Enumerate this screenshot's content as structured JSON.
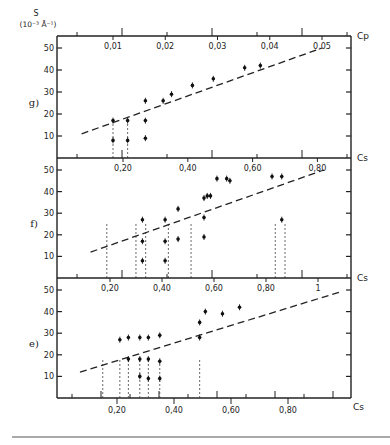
{
  "figure": {
    "y_axis_label": "S",
    "y_axis_unit": "(10⁻³ Å⁻¹)",
    "bottom_rule": true
  },
  "chart_data": [
    {
      "panel": "g)",
      "type": "scatter",
      "top_axis": {
        "label": "Cp",
        "ticks": [
          "0,01",
          "0,02",
          "0,03",
          "0,04",
          "0,05"
        ],
        "values": [
          0.01,
          0.02,
          0.03,
          0.04,
          0.05
        ]
      },
      "ylabel": "S (10^-3 A^-1)",
      "yticks": [
        10,
        20,
        30,
        40,
        50
      ],
      "ylim": [
        0,
        58
      ],
      "points": [
        {
          "x": 0.01,
          "y": 8
        },
        {
          "x": 0.01,
          "y": 17
        },
        {
          "x": 0.0128,
          "y": 8
        },
        {
          "x": 0.0128,
          "y": 17
        },
        {
          "x": 0.0162,
          "y": 9
        },
        {
          "x": 0.0162,
          "y": 17
        },
        {
          "x": 0.0162,
          "y": 26
        },
        {
          "x": 0.0196,
          "y": 26
        },
        {
          "x": 0.0212,
          "y": 29
        },
        {
          "x": 0.0252,
          "y": 33
        },
        {
          "x": 0.0292,
          "y": 36
        },
        {
          "x": 0.0352,
          "y": 41
        },
        {
          "x": 0.0382,
          "y": 42
        }
      ],
      "fit_line": {
        "style": "dashed",
        "x": [
          0.004,
          0.05
        ],
        "y": [
          11,
          50
        ]
      },
      "vertical_dotted_lines": [
        0.01,
        0.0128
      ]
    },
    {
      "panel": "f)",
      "type": "scatter",
      "top_axis": {
        "label": "Cs",
        "ticks": [
          "0,20",
          "0,40",
          "0,60",
          "0,80"
        ],
        "values": [
          0.2,
          0.4,
          0.6,
          0.8
        ]
      },
      "yticks": [
        10,
        20,
        30,
        40,
        50
      ],
      "ylim": [
        0,
        58
      ],
      "points": [
        {
          "x": 0.26,
          "y": 8
        },
        {
          "x": 0.26,
          "y": 17
        },
        {
          "x": 0.26,
          "y": 27
        },
        {
          "x": 0.33,
          "y": 8
        },
        {
          "x": 0.33,
          "y": 17
        },
        {
          "x": 0.33,
          "y": 27
        },
        {
          "x": 0.37,
          "y": 18
        },
        {
          "x": 0.37,
          "y": 32
        },
        {
          "x": 0.45,
          "y": 19
        },
        {
          "x": 0.45,
          "y": 28
        },
        {
          "x": 0.45,
          "y": 37
        },
        {
          "x": 0.46,
          "y": 38
        },
        {
          "x": 0.47,
          "y": 38
        },
        {
          "x": 0.49,
          "y": 46
        },
        {
          "x": 0.52,
          "y": 46
        },
        {
          "x": 0.53,
          "y": 45
        },
        {
          "x": 0.66,
          "y": 47
        },
        {
          "x": 0.69,
          "y": 47
        },
        {
          "x": 0.69,
          "y": 27
        }
      ],
      "fit_line": {
        "style": "dashed",
        "x": [
          0.1,
          0.82
        ],
        "y": [
          12,
          50
        ]
      },
      "vertical_dotted_lines": [
        0.15,
        0.24,
        0.27,
        0.34,
        0.41,
        0.67,
        0.7
      ]
    },
    {
      "panel": "e)",
      "type": "scatter",
      "top_axis": {
        "label": "Cs",
        "ticks": [
          "0,20",
          "0,40",
          "0,60",
          "0,80",
          "1"
        ],
        "values": [
          0.2,
          0.4,
          0.6,
          0.8,
          1.0
        ]
      },
      "bottom_axis": {
        "label": "Cs",
        "ticks": [
          "0,20",
          "0,40",
          "0,60",
          "0,80"
        ],
        "values": [
          0.2,
          0.4,
          0.6,
          0.8
        ]
      },
      "yticks": [
        10,
        20,
        30,
        40,
        50
      ],
      "ylim": [
        0,
        58
      ],
      "points": [
        {
          "x": 0.21,
          "y": 27
        },
        {
          "x": 0.24,
          "y": 28
        },
        {
          "x": 0.28,
          "y": 28
        },
        {
          "x": 0.31,
          "y": 28
        },
        {
          "x": 0.35,
          "y": 29
        },
        {
          "x": 0.24,
          "y": 18
        },
        {
          "x": 0.28,
          "y": 18
        },
        {
          "x": 0.31,
          "y": 18
        },
        {
          "x": 0.35,
          "y": 17
        },
        {
          "x": 0.28,
          "y": 10
        },
        {
          "x": 0.31,
          "y": 9
        },
        {
          "x": 0.35,
          "y": 9
        },
        {
          "x": 0.49,
          "y": 35
        },
        {
          "x": 0.49,
          "y": 28
        },
        {
          "x": 0.51,
          "y": 40
        },
        {
          "x": 0.57,
          "y": 39
        },
        {
          "x": 0.63,
          "y": 42
        }
      ],
      "fit_line": {
        "style": "dashed",
        "x": [
          0.07,
          0.98
        ],
        "y": [
          12,
          49
        ]
      },
      "vertical_dotted_lines": [
        0.15,
        0.21,
        0.24,
        0.28,
        0.31,
        0.35,
        0.49
      ]
    }
  ]
}
